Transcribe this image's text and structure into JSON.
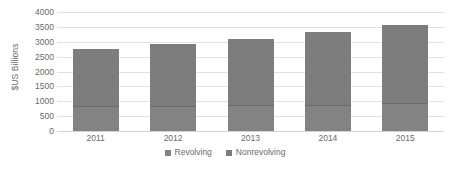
{
  "chart_data": {
    "type": "bar",
    "subtype": "stacked-bar",
    "title": "",
    "xlabel": "",
    "ylabel": "$US Billions",
    "categories": [
      "2011",
      "2012",
      "2013",
      "2014",
      "2015"
    ],
    "ylim": [
      0,
      4000
    ],
    "yticks": [
      4000,
      3500,
      3000,
      2500,
      2000,
      1500,
      1000,
      500,
      0
    ],
    "ytick_labels": [
      "4000",
      "3500",
      "3000",
      "2500",
      "2000",
      "1500",
      "1000",
      "500",
      "0"
    ],
    "grid": true,
    "legend_position": "bottom",
    "series": [
      {
        "name": "Revolving",
        "color": "#838383",
        "values": [
          840,
          850,
          860,
          890,
          935
        ]
      },
      {
        "name": "Nonrevolving",
        "color": "#7d7d7d",
        "values": [
          1915,
          2075,
          2235,
          2435,
          2615
        ]
      }
    ],
    "totals": [
      2755,
      2925,
      3095,
      3325,
      3550
    ]
  },
  "legend": {
    "items": [
      {
        "label": "Revolving",
        "swatch": "legend-swatch-revolving"
      },
      {
        "label": "Nonrevolving",
        "swatch": "legend-swatch-nonrevolving"
      }
    ]
  }
}
